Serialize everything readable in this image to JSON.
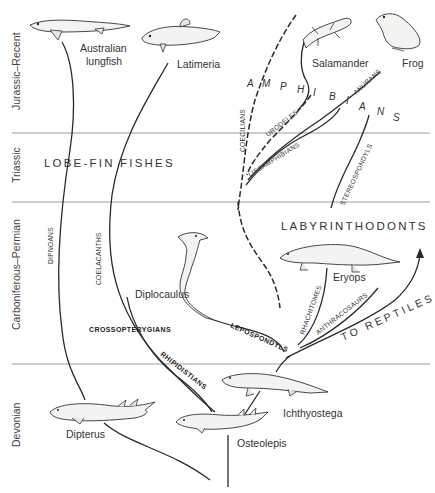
{
  "eras": [
    {
      "label": "Jurassic–Recent"
    },
    {
      "label": "Triassic"
    },
    {
      "label": "Carboniferous–Permian"
    },
    {
      "label": "Devonian"
    }
  ],
  "group_labels": {
    "lobe_fin": "LOBE-FIN FISHES",
    "labyrinthodonts": "LABYRINTHODONTS",
    "amphibians_letters": [
      "A",
      "M",
      "P",
      "H",
      "I",
      "B",
      "I",
      "A",
      "N",
      "S"
    ],
    "to_reptiles": "TO REPTILES"
  },
  "clades": {
    "dipnoans": "DIPNOANS",
    "coelacanths": "COELACANTHS",
    "crossopterygians": "CROSSOPTERYGIANS",
    "rhipidistians": "RHIPIDISTIANS",
    "lepospondyls": "LEPOSPONDYLS",
    "rhachitomes": "RHACHITOMES",
    "anthracosaurs": "ANTHRACOSAURS",
    "stereospondyls": "STEREOSPONDYLS",
    "coecilians": "COECILIANS",
    "urodeles": "URODELES",
    "lissamphibians": "LISSAMPHIBIANS",
    "anurans": "ANURANS"
  },
  "animals": {
    "australian_lungfish": [
      "Australian",
      "lungfish"
    ],
    "latimeria": "Latimeria",
    "salamander": "Salamander",
    "frog": "Frog",
    "diplocaulus": "Diplocaulus",
    "eryops": "Eryops",
    "ichthyostega": "Ichthyostega",
    "dipterus": "Dipterus",
    "osteolepis": "Osteolepis"
  }
}
